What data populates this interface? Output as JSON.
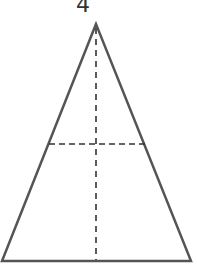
{
  "diagram": {
    "label": "4",
    "shape": "isosceles-triangle",
    "stroke_color": "#555555",
    "dash_color": "#333333",
    "apex": [
      96,
      24
    ],
    "base_left": [
      2,
      261
    ],
    "base_right": [
      191,
      261
    ],
    "midline": {
      "from": [
        48,
        144
      ],
      "to": [
        145,
        144
      ],
      "style": "dashed"
    },
    "height_line": {
      "from": [
        96,
        24
      ],
      "to": [
        96,
        261
      ],
      "style": "dashed"
    }
  }
}
